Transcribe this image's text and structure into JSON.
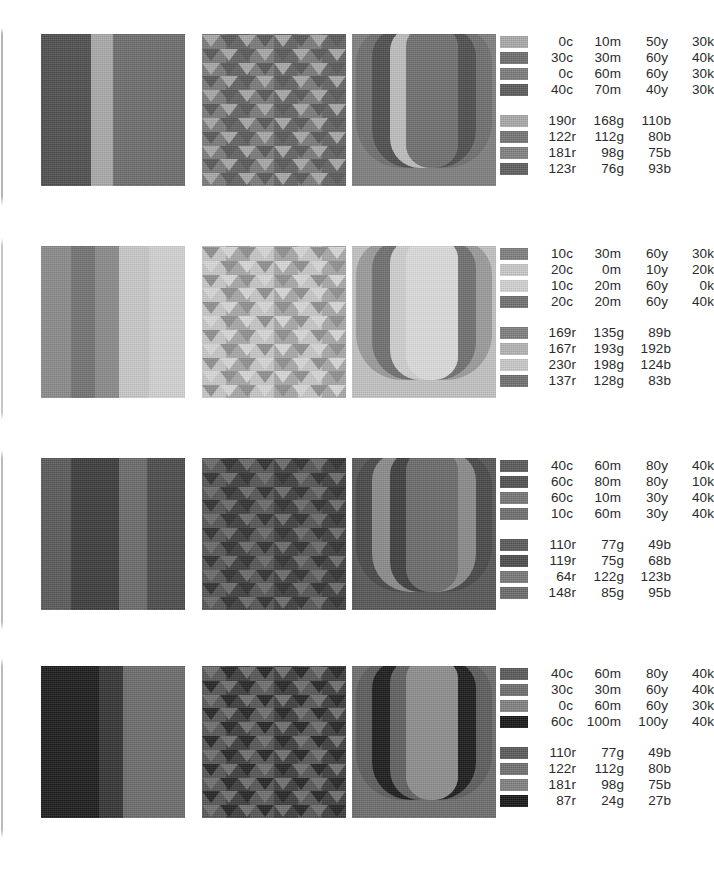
{
  "page": {
    "width": 710,
    "height": 877,
    "background": "#ffffff"
  },
  "rows": [
    {
      "id": "row-1",
      "top": 34,
      "stripes": {
        "widths": [
          28,
          22,
          22,
          22,
          50
        ],
        "tones": [
          "#4e4e4e",
          "#4e4e4e",
          "#a9a9a9",
          "#6d6d6d",
          "#6d6d6d"
        ]
      },
      "triangles": {
        "background": "#6d6d6d",
        "stripe_widths": [
          24,
          24,
          24,
          24,
          24,
          24
        ],
        "stripe_tones": [
          "#7a7a7a",
          "#636363",
          "#7a7a7a",
          "#636363",
          "#7a7a7a",
          "#636363"
        ],
        "triangle_tones": [
          "#a8a8a8",
          "#585858"
        ],
        "direction": "down"
      },
      "letter": {
        "glyph": "U",
        "background": "#7f7f7f",
        "ring_tones": [
          "#6e6e6e",
          "#4d4d4d",
          "#bdbdbd",
          "#6f6f6f"
        ]
      },
      "legend": {
        "top": 34,
        "cmyk": [
          {
            "swatch": "#a9a9a9",
            "c": "0c",
            "m": "10m",
            "y": "50y",
            "k": "30k"
          },
          {
            "swatch": "#6d6d6d",
            "c": "30c",
            "m": "30m",
            "y": "60y",
            "k": "40k"
          },
          {
            "swatch": "#7b7b7b",
            "c": "0c",
            "m": "60m",
            "y": "60y",
            "k": "30k"
          },
          {
            "swatch": "#5a5a5a",
            "c": "40c",
            "m": "70m",
            "y": "40y",
            "k": "30k"
          }
        ],
        "rgb": [
          {
            "swatch": "#a9a9a9",
            "r": "190r",
            "g": "168g",
            "b": "110b"
          },
          {
            "swatch": "#737373",
            "r": "122r",
            "g": "112g",
            "b": "80b"
          },
          {
            "swatch": "#808080",
            "r": "181r",
            "g": "98g",
            "b": "75b"
          },
          {
            "swatch": "#5e5e5e",
            "r": "123r",
            "g": "76g",
            "b": "93b"
          }
        ]
      }
    },
    {
      "id": "row-2",
      "top": 246,
      "stripes": {
        "widths": [
          30,
          24,
          24,
          30,
          36
        ],
        "tones": [
          "#8a8a8a",
          "#727272",
          "#8a8a8a",
          "#c8c8c8",
          "#d2d2d2"
        ]
      },
      "triangles": {
        "background": "#bdbdbd",
        "stripe_widths": [
          24,
          24,
          24,
          24,
          24,
          24
        ],
        "stripe_tones": [
          "#c7c7c7",
          "#a8a8a8",
          "#c7c7c7",
          "#a8a8a8",
          "#c7c7c7",
          "#a8a8a8"
        ],
        "triangle_tones": [
          "#8f8f8f",
          "#d8d8d8"
        ],
        "direction": "down"
      },
      "letter": {
        "glyph": "U",
        "background": "#c2c2c2",
        "ring_tones": [
          "#9a9a9a",
          "#6f6f6f",
          "#cfcfcf",
          "#dcdcdc"
        ]
      },
      "legend": {
        "top": 246,
        "cmyk": [
          {
            "swatch": "#7d7d7d",
            "c": "10c",
            "m": "30m",
            "y": "60y",
            "k": "30k"
          },
          {
            "swatch": "#c9c9c9",
            "c": "20c",
            "m": "0m",
            "y": "10y",
            "k": "20k"
          },
          {
            "swatch": "#d2d2d2",
            "c": "10c",
            "m": "20m",
            "y": "60y",
            "k": "0k"
          },
          {
            "swatch": "#6f6f6f",
            "c": "20c",
            "m": "20m",
            "y": "60y",
            "k": "40k"
          }
        ],
        "rgb": [
          {
            "swatch": "#7d7d7d",
            "r": "169r",
            "g": "135g",
            "b": "89b"
          },
          {
            "swatch": "#b4b4b4",
            "r": "167r",
            "g": "193g",
            "b": "192b"
          },
          {
            "swatch": "#c9c9c9",
            "r": "230r",
            "g": "198g",
            "b": "124b"
          },
          {
            "swatch": "#6f6f6f",
            "r": "137r",
            "g": "128g",
            "b": "83b"
          }
        ]
      }
    },
    {
      "id": "row-3",
      "top": 458,
      "stripes": {
        "widths": [
          30,
          22,
          26,
          28,
          38
        ],
        "tones": [
          "#595959",
          "#3a3a3a",
          "#3a3a3a",
          "#6a6a6a",
          "#4a4a4a"
        ]
      },
      "triangles": {
        "background": "#4a4a4a",
        "stripe_widths": [
          24,
          24,
          24,
          24,
          24,
          24
        ],
        "stripe_tones": [
          "#545454",
          "#3e3e3e",
          "#545454",
          "#3e3e3e",
          "#545454",
          "#3e3e3e"
        ],
        "triangle_tones": [
          "#6a6a6a",
          "#303030"
        ],
        "direction": "down"
      },
      "letter": {
        "glyph": "U",
        "background": "#565656",
        "ring_tones": [
          "#474747",
          "#8a8a8a",
          "#3d3d3d",
          "#6a6a6a"
        ]
      },
      "legend": {
        "top": 458,
        "cmyk": [
          {
            "swatch": "#585858",
            "c": "40c",
            "m": "60m",
            "y": "80y",
            "k": "40k"
          },
          {
            "swatch": "#4f4f4f",
            "c": "60c",
            "m": "80m",
            "y": "80y",
            "k": "10k"
          },
          {
            "swatch": "#747474",
            "c": "60c",
            "m": "10m",
            "y": "30y",
            "k": "40k"
          },
          {
            "swatch": "#6e6e6e",
            "c": "10c",
            "m": "60m",
            "y": "30y",
            "k": "40k"
          }
        ],
        "rgb": [
          {
            "swatch": "#585858",
            "r": "110r",
            "g": "77g",
            "b": "49b"
          },
          {
            "swatch": "#4a4a4a",
            "r": "119r",
            "g": "75g",
            "b": "68b"
          },
          {
            "swatch": "#777777",
            "r": "64r",
            "g": "122g",
            "b": "123b"
          },
          {
            "swatch": "#6a6a6a",
            "r": "148r",
            "g": "85g",
            "b": "95b"
          }
        ]
      }
    },
    {
      "id": "row-4",
      "top": 666,
      "stripes": {
        "widths": [
          32,
          26,
          24,
          30,
          32
        ],
        "tones": [
          "#1a1a1a",
          "#1a1a1a",
          "#333333",
          "#6b6b6b",
          "#6b6b6b"
        ]
      },
      "triangles": {
        "background": "#4a4a4a",
        "stripe_widths": [
          24,
          24,
          24,
          24,
          24,
          24
        ],
        "stripe_tones": [
          "#555555",
          "#3c3c3c",
          "#555555",
          "#3c3c3c",
          "#555555",
          "#3c3c3c"
        ],
        "triangle_tones": [
          "#6f6f6f",
          "#242424"
        ],
        "direction": "down"
      },
      "letter": {
        "glyph": "U",
        "background": "#6c6c6c",
        "ring_tones": [
          "#5b5b5b",
          "#1a1a1a",
          "#5f5f5f",
          "#8d8d8d"
        ]
      },
      "legend": {
        "top": 666,
        "cmyk": [
          {
            "swatch": "#585858",
            "c": "40c",
            "m": "60m",
            "y": "80y",
            "k": "40k"
          },
          {
            "swatch": "#6d6d6d",
            "c": "30c",
            "m": "30m",
            "y": "60y",
            "k": "40k"
          },
          {
            "swatch": "#808080",
            "c": "0c",
            "m": "60m",
            "y": "60y",
            "k": "30k"
          },
          {
            "swatch": "#141414",
            "c": "60c",
            "m": "100m",
            "y": "100y",
            "k": "40k"
          }
        ],
        "rgb": [
          {
            "swatch": "#585858",
            "r": "110r",
            "g": "77g",
            "b": "49b"
          },
          {
            "swatch": "#6f6f6f",
            "r": "122r",
            "g": "112g",
            "b": "80b"
          },
          {
            "swatch": "#808080",
            "r": "181r",
            "g": "98g",
            "b": "75b"
          },
          {
            "swatch": "#141414",
            "r": "87r",
            "g": "24g",
            "b": "27b"
          }
        ]
      }
    }
  ]
}
